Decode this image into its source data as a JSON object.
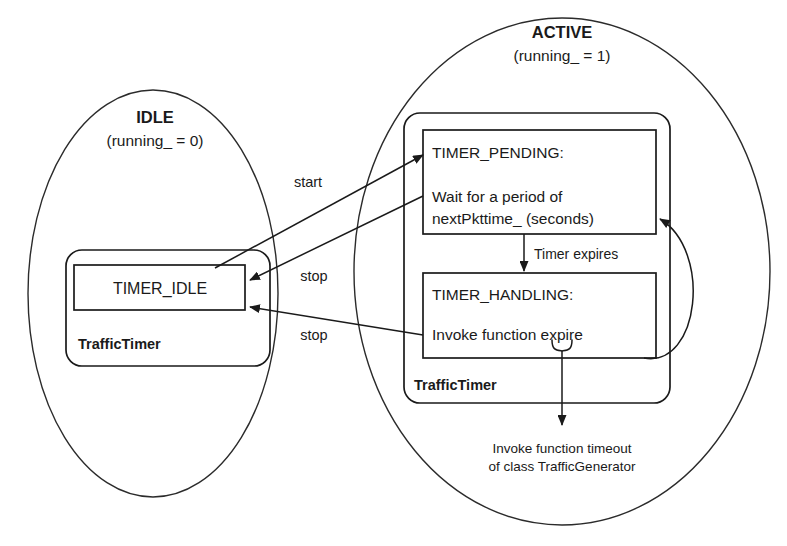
{
  "diagram": {
    "background_color": "#ffffff",
    "line_color": "#1a1a1a"
  },
  "regions": [
    {
      "id": "idle",
      "title": "IDLE",
      "subtitle": "(running_ = 0)",
      "class_label": "TrafficTimer",
      "states": [
        {
          "id": "timer_idle",
          "name": "TIMER_IDLE"
        }
      ]
    },
    {
      "id": "active",
      "title": "ACTIVE",
      "subtitle": "(running_ = 1)",
      "class_label": "TrafficTimer",
      "states": [
        {
          "id": "timer_pending",
          "name": "TIMER_PENDING:",
          "body_line1": "Wait for a period of",
          "body_line2": "nextPkttime_ (seconds)"
        },
        {
          "id": "timer_handling",
          "name": "TIMER_HANDLING:",
          "body_line1": "Invoke function expire"
        }
      ]
    }
  ],
  "transitions": [
    {
      "id": "start",
      "label": "start",
      "from": "timer_idle",
      "to": "timer_pending"
    },
    {
      "id": "stop_pending",
      "label": "stop",
      "from": "timer_pending",
      "to": "timer_idle"
    },
    {
      "id": "stop_handling",
      "label": "stop",
      "from": "timer_handling",
      "to": "timer_idle"
    },
    {
      "id": "timer_expires",
      "label": "Timer expires",
      "from": "timer_pending",
      "to": "timer_handling"
    },
    {
      "id": "reschedule",
      "label": "",
      "from": "timer_handling",
      "to": "timer_pending"
    }
  ],
  "annotations": {
    "callout_line1": "Invoke function timeout",
    "callout_line2": "of class TrafficGenerator"
  }
}
